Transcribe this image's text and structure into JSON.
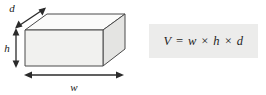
{
  "figure": {
    "type": "geometry-diagram",
    "shape": "rectangular box (cuboid)",
    "dimension_labels": {
      "depth": "d",
      "height": "h",
      "width": "w"
    },
    "formula": {
      "text": "V = w × h × d",
      "volume_symbol": "V",
      "operator": "×",
      "background_color": "#ececeb",
      "text_color": "#1e1e1e"
    },
    "colors": {
      "front_face": "#f1f1ef",
      "top_face": "#fbfbfa",
      "side_face": "#e4e4e2",
      "outline": "#4a4a4a",
      "arrow": "#2b2b2b",
      "page_background": "#ffffff"
    }
  }
}
